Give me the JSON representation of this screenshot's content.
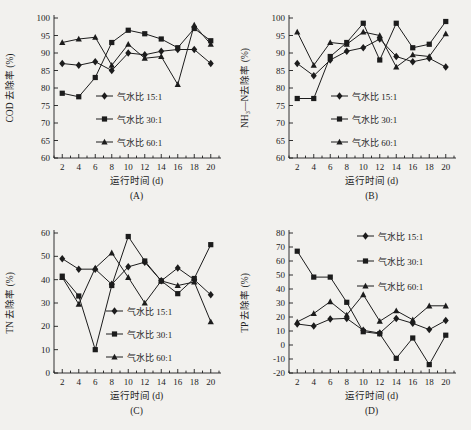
{
  "page": {
    "background": "#f2f1ee",
    "ink_color": "#1c1c1c"
  },
  "chart_data": [
    {
      "id": "A",
      "type": "line",
      "panel_label": "(A)",
      "title": "",
      "xlabel": "运行时间 (d)",
      "ylabel": "COD 去除率 (%)",
      "x": [
        2,
        4,
        6,
        8,
        10,
        12,
        14,
        16,
        18,
        20
      ],
      "xlim": [
        1,
        21
      ],
      "ylim": [
        60,
        100
      ],
      "xtick_step": 2,
      "ytick_step": 5,
      "grid": false,
      "legend_pos": "inside-bottom-center",
      "series": [
        {
          "name": "气水比 15:1",
          "marker": "diamond",
          "values": [
            87,
            86.5,
            87.5,
            85,
            90,
            89.5,
            90.5,
            91,
            91,
            87
          ]
        },
        {
          "name": "气水比 30:1",
          "marker": "square",
          "values": [
            78.5,
            77.5,
            83,
            93,
            96.5,
            95.5,
            94,
            91.5,
            97,
            93.5
          ]
        },
        {
          "name": "气水比 60:1",
          "marker": "triangle",
          "values": [
            93,
            94,
            94.5,
            86.5,
            92.5,
            88.5,
            89,
            81,
            98,
            92.5
          ]
        }
      ]
    },
    {
      "id": "B",
      "type": "line",
      "panel_label": "(B)",
      "title": "",
      "xlabel": "运行时间 (d)",
      "ylabel": "NH₃—N去除率 (%)",
      "x": [
        2,
        4,
        6,
        8,
        10,
        12,
        14,
        16,
        18,
        20
      ],
      "xlim": [
        1,
        21
      ],
      "ylim": [
        60,
        100
      ],
      "xtick_step": 2,
      "ytick_step": 5,
      "grid": false,
      "legend_pos": "inside-bottom-center",
      "series": [
        {
          "name": "气水比 15:1",
          "marker": "diamond",
          "values": [
            87,
            83.5,
            88,
            90.5,
            91.5,
            94,
            89,
            87.5,
            88.5,
            86
          ]
        },
        {
          "name": "气水比 30:1",
          "marker": "square",
          "values": [
            77,
            77,
            89,
            93,
            98.5,
            88,
            98.5,
            91.5,
            92.5,
            99
          ]
        },
        {
          "name": "气水比 60:1",
          "marker": "triangle",
          "values": [
            96,
            86.5,
            93,
            92.5,
            96,
            95,
            86,
            89.5,
            89,
            95.5
          ]
        }
      ]
    },
    {
      "id": "C",
      "type": "line",
      "panel_label": "(C)",
      "title": "",
      "xlabel": "运行时间 (d)",
      "ylabel": "TN 去除率 (%)",
      "x": [
        2,
        4,
        6,
        8,
        10,
        12,
        14,
        16,
        18,
        20
      ],
      "xlim": [
        1,
        21
      ],
      "ylim": [
        0,
        60
      ],
      "xtick_step": 2,
      "ytick_step": 10,
      "grid": false,
      "legend_pos": "inside-bottom-center-right",
      "series": [
        {
          "name": "气水比 15:1",
          "marker": "diamond",
          "values": [
            49,
            44.5,
            44.5,
            38,
            45.5,
            47.5,
            39.5,
            45,
            40,
            33.5
          ]
        },
        {
          "name": "气水比 30:1",
          "marker": "square",
          "values": [
            41.5,
            33,
            10,
            37.5,
            58.5,
            48,
            39.5,
            34,
            40.5,
            55
          ]
        },
        {
          "name": "气水比 60:1",
          "marker": "triangle",
          "values": [
            41,
            29.5,
            45,
            51.5,
            41,
            30,
            39.5,
            37.5,
            39,
            22
          ]
        }
      ]
    },
    {
      "id": "D",
      "type": "line",
      "panel_label": "(D)",
      "title": "",
      "xlabel": "运行时间 (d)",
      "ylabel": "TP 去除率 (%)",
      "x": [
        2,
        4,
        6,
        8,
        10,
        12,
        14,
        16,
        18,
        20
      ],
      "xlim": [
        1,
        21
      ],
      "ylim": [
        -20,
        80
      ],
      "xtick_step": 2,
      "ytick_step": 10,
      "grid": false,
      "legend_pos": "inside-top-right",
      "series": [
        {
          "name": "气水比 15:1",
          "marker": "diamond",
          "values": [
            15,
            13.5,
            18.5,
            19,
            10.5,
            8.5,
            19,
            15.5,
            11,
            17.5
          ]
        },
        {
          "name": "气水比 30:1",
          "marker": "square",
          "values": [
            67,
            48.5,
            48.5,
            30.5,
            9.5,
            8,
            -9.5,
            5,
            -14,
            7
          ]
        },
        {
          "name": "气水比 60:1",
          "marker": "triangle",
          "values": [
            16.5,
            22.5,
            31,
            21.5,
            36,
            17,
            24.5,
            18,
            28,
            28
          ]
        }
      ]
    }
  ]
}
